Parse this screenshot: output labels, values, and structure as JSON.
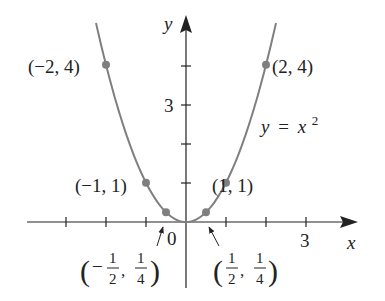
{
  "chart_data": {
    "type": "line",
    "title": "",
    "function_label": "y = x^2",
    "function_label_parts": {
      "lhs": "y",
      "eq": "=",
      "base": "x",
      "exp": "2"
    },
    "xlabel": "x",
    "ylabel": "y",
    "origin_label": "0",
    "xlim": [
      -4,
      4.3
    ],
    "ylim": [
      0,
      5.2
    ],
    "x_tick_values": [
      -3,
      -2,
      -1,
      1,
      2,
      3
    ],
    "x_tick_labels": [
      {
        "value": 3,
        "label": "3"
      }
    ],
    "y_tick_values": [
      1,
      2,
      3,
      4
    ],
    "y_tick_labels": [
      {
        "value": 3,
        "label": "3"
      }
    ],
    "grid": false,
    "curve": {
      "domain": [
        -2.25,
        2.25
      ],
      "color": "#7f7f7f"
    },
    "points": [
      {
        "x": -2,
        "y": 4,
        "label": "(−2, 4)"
      },
      {
        "x": -1,
        "y": 1,
        "label": "(−1, 1)"
      },
      {
        "x": -0.5,
        "y": 0.25,
        "label": "(−1/2, 1/4)",
        "label_parts": {
          "sign": "−",
          "xn": "1",
          "xd": "2",
          "yn": "1",
          "yd": "4"
        }
      },
      {
        "x": 0.5,
        "y": 0.25,
        "label": "(1/2, 1/4)",
        "label_parts": {
          "sign": "",
          "xn": "1",
          "xd": "2",
          "yn": "1",
          "yd": "4"
        }
      },
      {
        "x": 1,
        "y": 1,
        "label": "(1, 1)"
      },
      {
        "x": 2,
        "y": 4,
        "label": "(2, 4)"
      }
    ],
    "colors": {
      "axis": "#222222",
      "curve": "#7f7f7f",
      "point": "#7f7f7f",
      "text": "#222222"
    }
  }
}
